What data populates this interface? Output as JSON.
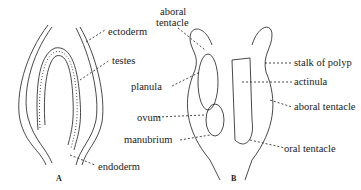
{
  "figure_a": {
    "letter": "A",
    "labels": {
      "ectoderm": "ectoderm",
      "testes": "testes",
      "endoderm": "endoderm"
    }
  },
  "figure_b": {
    "letter": "B",
    "labels": {
      "aboral_tentacle_top_1": "aboral",
      "aboral_tentacle_top_2": "tentacle",
      "planula": "planula",
      "ovum": "ovum",
      "manubrium": "manubrium",
      "stalk_of_polyp": "stalk of polyp",
      "actinula": "actinula",
      "aboral_tentacle": "aboral tentacle",
      "oral_tentacle": "oral tentacle"
    }
  },
  "caption": "",
  "colors": {
    "ink": "#1a1a1a",
    "background": "#ffffff"
  }
}
